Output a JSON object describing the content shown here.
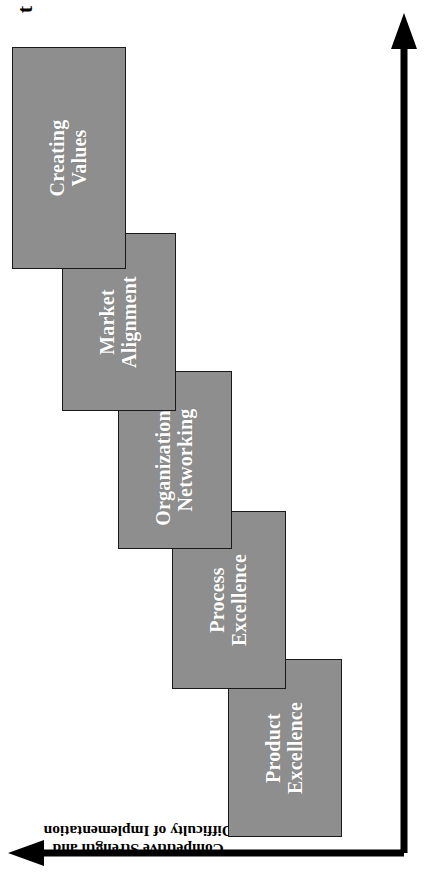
{
  "figure": {
    "type": "staircase-maturity-diagram",
    "orientation_note": "rotated-90-ccw",
    "background_color": "#ffffff",
    "box_fill_color": "#8e8e8e",
    "box_border_color": "#1a1a1a",
    "box_text_color": "#ffffff",
    "axis_color": "#000000",
    "caption": ""
  },
  "axes": {
    "vertical": {
      "label": "Competitive Strength and\nDifficulty of Implementation",
      "arrow": "up"
    },
    "horizontal": {
      "label": "t",
      "arrow": "right"
    }
  },
  "chart_data": {
    "type": "bar",
    "title": "",
    "xlabel": "t",
    "ylabel": "Competitive Strength and Difficulty of Implementation",
    "categories": [
      "Product Excellence",
      "Process Excellence",
      "Organizational Networking",
      "Market Alignment",
      "Creating Values"
    ],
    "values": [
      1,
      2,
      3,
      4,
      5
    ],
    "ylim": [
      0,
      5
    ],
    "grid": false,
    "legend": "none",
    "annotations": [
      "Ascending staircase of five overlapping rectangles",
      "Each successive stage is offset up and to the right"
    ]
  },
  "stages": [
    {
      "id": "product-excellence",
      "label": "Product\nExcellence",
      "order": 1,
      "left": 42,
      "top": 228,
      "width": 178,
      "height": 114
    },
    {
      "id": "process-excellence",
      "label": "Process\nExcellence",
      "order": 2,
      "left": 190,
      "top": 172,
      "width": 178,
      "height": 114
    },
    {
      "id": "organizational-networking",
      "label": "Organizational\nNetworking",
      "order": 3,
      "left": 330,
      "top": 118,
      "width": 178,
      "height": 114
    },
    {
      "id": "market-alignment",
      "label": "Market\nAlignment",
      "order": 4,
      "left": 468,
      "top": 62,
      "width": 178,
      "height": 114
    },
    {
      "id": "creating-values",
      "label": "Creating\nValues",
      "order": 5,
      "left": 610,
      "top": 12,
      "width": 222,
      "height": 114
    }
  ]
}
